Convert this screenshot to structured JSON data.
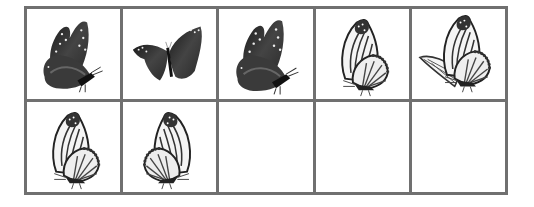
{
  "grid": {
    "rows": 2,
    "columns": 5,
    "border_color": "#707070",
    "cells": [
      {
        "row": 1,
        "col": 1,
        "content": "dark-butterfly-side-left",
        "style": "dark"
      },
      {
        "row": 1,
        "col": 2,
        "content": "dark-butterfly-open-wings",
        "style": "dark"
      },
      {
        "row": 1,
        "col": 3,
        "content": "dark-butterfly-side-left",
        "style": "dark"
      },
      {
        "row": 1,
        "col": 4,
        "content": "monarch-butterfly-side-left",
        "style": "light"
      },
      {
        "row": 1,
        "col": 5,
        "content": "monarch-butterfly-flying",
        "style": "light"
      },
      {
        "row": 2,
        "col": 1,
        "content": "monarch-butterfly-side-right",
        "style": "light"
      },
      {
        "row": 2,
        "col": 2,
        "content": "monarch-butterfly-side-left-mirrored",
        "style": "light"
      },
      {
        "row": 2,
        "col": 3,
        "content": "empty"
      },
      {
        "row": 2,
        "col": 4,
        "content": "empty"
      },
      {
        "row": 2,
        "col": 5,
        "content": "empty"
      }
    ]
  }
}
